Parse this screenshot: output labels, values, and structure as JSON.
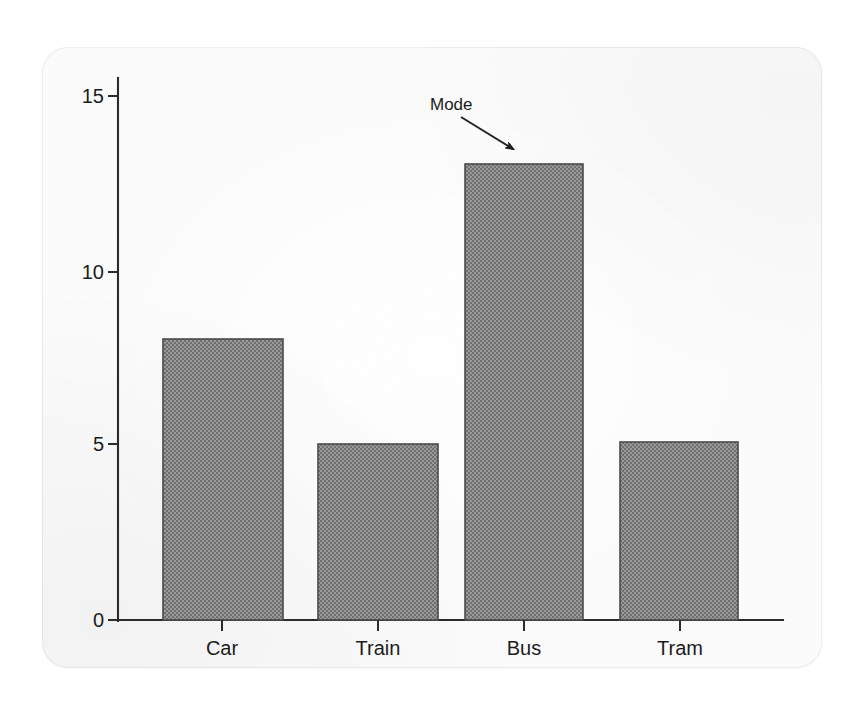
{
  "chart_data": {
    "type": "bar",
    "title": "",
    "subtitle": "",
    "xlabel": "",
    "ylabel": "",
    "categories": [
      "Car",
      "Train",
      "Bus",
      "Tram"
    ],
    "values": [
      8,
      5,
      13,
      5
    ],
    "series": [
      {
        "name": "Frequency",
        "values": [
          8,
          5,
          13,
          5
        ]
      }
    ],
    "ylim": [
      0,
      15
    ],
    "y_ticks": [
      0,
      5,
      10,
      15
    ],
    "y_tick_labels": [
      "0",
      "5",
      "10",
      "15"
    ],
    "x_tick_labels": [
      "Car",
      "Train",
      "Bus",
      "Tram"
    ],
    "grid": false,
    "legend": false,
    "legend_position": "none",
    "annotations": [
      {
        "text": "Mode",
        "points_to_category": "Bus",
        "points_to_value": 13
      }
    ],
    "colors": {
      "bar_fill": "#8d8d8d",
      "bar_edge": "#4a4a4a",
      "axis": "#2b2b2b",
      "text": "#1c1c1c",
      "card_background": "#fbfbfb",
      "page_background": "#ffffff"
    }
  },
  "geometry": {
    "axis_x": 118,
    "baseline_y": 620,
    "axis_top_y": 78,
    "baseline_right_x": 783,
    "y_tick_pixels": [
      620,
      444,
      272,
      96
    ],
    "x_tick_pixels": [
      222,
      378,
      524,
      680
    ],
    "bars": [
      {
        "x": 163,
        "width": 120,
        "top": 339
      },
      {
        "x": 318,
        "width": 120,
        "top": 444
      },
      {
        "x": 465,
        "width": 118,
        "top": 164
      },
      {
        "x": 620,
        "width": 118,
        "top": 442
      }
    ],
    "annotation": {
      "text_x": 430,
      "text_y": 110,
      "line_x1": 461,
      "line_y1": 117,
      "line_x2": 515,
      "line_y2": 150
    }
  }
}
